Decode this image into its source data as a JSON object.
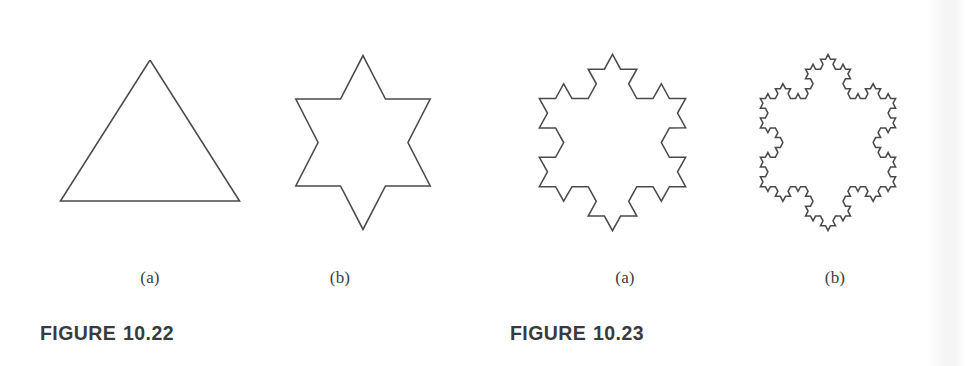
{
  "page": {
    "background": "#ffffff",
    "stroke_color": "#4a4a4c",
    "text_color": "#3a3a3c"
  },
  "figures": [
    {
      "id": "figure-10-22",
      "caption_word": "FIGURE",
      "caption_number": "10.22",
      "caption_x": 40,
      "caption_y": 322,
      "panels": [
        {
          "id": "panel-10-22-a",
          "label": "(a)",
          "label_x": 150,
          "label_y": 268,
          "iteration": 0,
          "shape_name": "equilateral-triangle-inverted",
          "x": 40,
          "y": 60,
          "w": 220,
          "h": 200,
          "center_x": 0.5,
          "center_y": 0.47,
          "radius": 0.47,
          "rotation_deg": -90
        },
        {
          "id": "panel-10-22-b",
          "label": "(b)",
          "label_x": 340,
          "label_y": 268,
          "iteration": 1,
          "shape_name": "koch-snowflake-iteration-1-star-of-david",
          "x": 258,
          "y": 25,
          "w": 210,
          "h": 235,
          "center_x": 0.5,
          "center_y": 0.5,
          "radius": 0.37,
          "rotation_deg": -90
        }
      ]
    },
    {
      "id": "figure-10-23",
      "caption_word": "FIGURE",
      "caption_number": "10.23",
      "caption_x": 510,
      "caption_y": 322,
      "panels": [
        {
          "id": "panel-10-23-a",
          "label": "(a)",
          "label_x": 625,
          "label_y": 268,
          "iteration": 2,
          "shape_name": "koch-snowflake-iteration-2",
          "x": 500,
          "y": 25,
          "w": 225,
          "h": 235,
          "center_x": 0.5,
          "center_y": 0.5,
          "radius": 0.375,
          "rotation_deg": -90
        },
        {
          "id": "panel-10-23-b",
          "label": "(b)",
          "label_x": 835,
          "label_y": 268,
          "iteration": 3,
          "shape_name": "koch-snowflake-iteration-3",
          "x": 724,
          "y": 25,
          "w": 208,
          "h": 235,
          "center_x": 0.5,
          "center_y": 0.5,
          "radius": 0.375,
          "rotation_deg": -90
        }
      ]
    }
  ]
}
